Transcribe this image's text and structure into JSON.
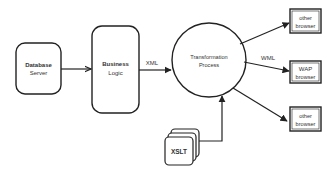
{
  "diagram": {
    "type": "architecture-flow",
    "nodes": {
      "database_server": {
        "line1": "Database",
        "line2": "Server"
      },
      "business_logic": {
        "line1": "Business",
        "line2": "Logic"
      },
      "transformation_process": {
        "line1": "Transformation",
        "line2": "Process"
      },
      "xslt": {
        "label": "XSLT"
      },
      "browser_top": {
        "line1": "other",
        "line2": "browser"
      },
      "browser_wap": {
        "line1": "WAP",
        "line2": "browser"
      },
      "browser_bottom": {
        "line1": "other",
        "line2": "browser"
      }
    },
    "edges": [
      {
        "from": "Database Server",
        "to": "Business Logic",
        "label": ""
      },
      {
        "from": "Business Logic",
        "to": "Transformation Process",
        "label": "XML"
      },
      {
        "from": "XSLT",
        "to": "Transformation Process",
        "label": ""
      },
      {
        "from": "Transformation Process",
        "to": "other browser (top)",
        "label": ""
      },
      {
        "from": "Transformation Process",
        "to": "WAP browser",
        "label": "WML"
      },
      {
        "from": "Transformation Process",
        "to": "other browser (bottom)",
        "label": ""
      }
    ],
    "edge_labels": {
      "xml": "XML",
      "wml": "WML"
    },
    "colors": {
      "stroke": "#222222",
      "text": "#333333",
      "background": "#ffffff"
    }
  }
}
